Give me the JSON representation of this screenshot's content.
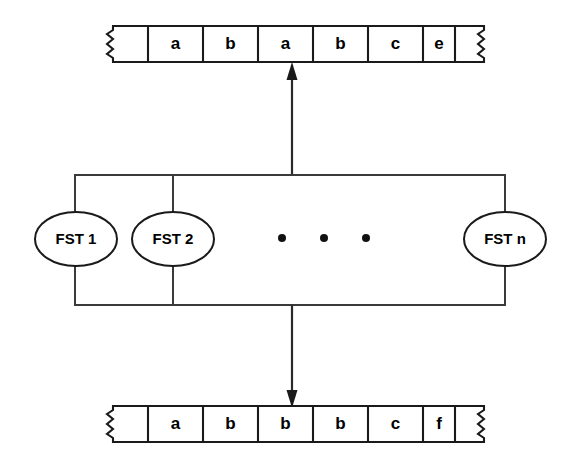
{
  "figure": {
    "background_color": "#ffffff",
    "line_color": "#1a1a1a"
  },
  "top_tape": {
    "name": "upper-tape",
    "cells": [
      "a",
      "b",
      "a",
      "b",
      "c",
      "e"
    ],
    "has_left_torn_edge": true,
    "has_right_torn_edge": true,
    "blank_cell_left": "",
    "blank_cell_right": ""
  },
  "bottom_tape": {
    "name": "lower-tape",
    "cells": [
      "a",
      "b",
      "b",
      "b",
      "c",
      "f"
    ],
    "has_left_torn_edge": true,
    "has_right_torn_edge": true,
    "blank_cell_left": "",
    "blank_cell_right": ""
  },
  "transducers": {
    "items": [
      {
        "label": "FST 1"
      },
      {
        "label": "FST 2"
      },
      {
        "label": "FST n"
      }
    ],
    "ellipsis_dot_count": 3
  },
  "arrows": {
    "up_arrow_label": "output to upper tape",
    "down_arrow_label": "input from lower tape"
  }
}
